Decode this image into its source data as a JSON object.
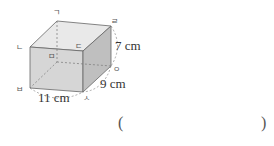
{
  "figure": {
    "type": "rectangular-prism",
    "vertices": {
      "top_back_left": "ㄱ",
      "top_front_left": "ㄴ",
      "top_front_right": "ㄷ",
      "top_back_right": "ㄹ",
      "bottom_back_left": "ㅁ",
      "bottom_front_left": "ㅂ",
      "bottom_front_right": "ㅅ",
      "bottom_back_right": "ㅇ"
    },
    "dimensions": {
      "height": "7 cm",
      "depth": "9 cm",
      "width": "11 cm"
    },
    "colors": {
      "top_face": "#e8e8e8",
      "front_face": "#d4d4d4",
      "side_face": "#bdbdbd",
      "edge": "#666666"
    }
  },
  "answer": {
    "open_paren": "(",
    "close_paren": ")",
    "value": ""
  }
}
